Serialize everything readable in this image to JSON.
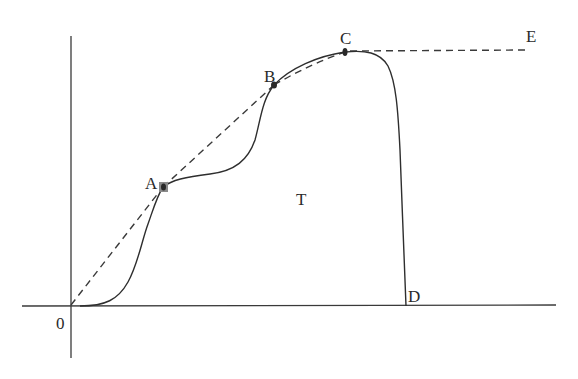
{
  "diagram": {
    "type": "stress-strain style curve",
    "labels": {
      "origin": "0",
      "A": "A",
      "B": "B",
      "C": "C",
      "D": "D",
      "E": "E",
      "T": "T"
    },
    "points": [
      {
        "name": "0",
        "x": 71,
        "y": 306
      },
      {
        "name": "A",
        "x": 163,
        "y": 187
      },
      {
        "name": "B",
        "x": 274,
        "y": 85
      },
      {
        "name": "C",
        "x": 345,
        "y": 52
      },
      {
        "name": "D",
        "x": 406,
        "y": 306
      },
      {
        "name": "E",
        "x": 525,
        "y": 50
      }
    ],
    "segments": [
      {
        "from": "0",
        "to": "A",
        "style": "dashed"
      },
      {
        "from": "A",
        "to": "B",
        "style": "dashed"
      },
      {
        "from": "B",
        "to": "C",
        "style": "dashed"
      },
      {
        "from": "C",
        "to": "E",
        "style": "dashed"
      },
      {
        "from": "0",
        "to": "D",
        "style": "solid-curve",
        "through": [
          "A",
          "B",
          "C"
        ]
      }
    ],
    "colors": {
      "line": "#2e2e2e",
      "background": "#ffffff"
    }
  }
}
